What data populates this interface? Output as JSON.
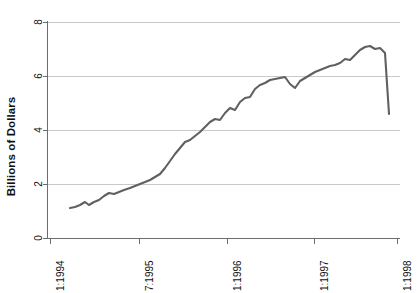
{
  "chart": {
    "type": "line",
    "ylabel": "Billions of Dollars",
    "xlabel": "",
    "title": "",
    "grid": true,
    "legend": false,
    "line_color": "#606060",
    "grid_color": "#c9c9c9",
    "axis_color": "#6d6d6d"
  },
  "axes": {
    "y_ticks": [
      "0",
      "2",
      "4",
      "6",
      "8"
    ],
    "y_values": [
      0,
      2,
      4,
      6,
      8
    ],
    "ylim": [
      0,
      8
    ],
    "x_ticks": [
      "1:1994",
      "7:1995",
      "1:1996",
      "1:1997",
      "1:1998"
    ],
    "x_tick_values": [
      1994.0,
      1995.5,
      1996.0,
      1997.0,
      1998.0
    ],
    "xlim": [
      1994.0,
      1998.0
    ]
  },
  "chart_data": {
    "type": "line",
    "title": "",
    "xlabel": "",
    "ylabel": "Billions of Dollars",
    "ylim": [
      0,
      8
    ],
    "xlim": [
      1994.0,
      1998.0
    ],
    "grid": true,
    "legend": false,
    "xtick_labels": [
      "1:1994",
      "7:1995",
      "1:1996",
      "1:1997",
      "1:1998"
    ],
    "ytick_labels": [
      "0",
      "2",
      "4",
      "6",
      "8"
    ],
    "x": [
      1994.58,
      1994.67,
      1994.75,
      1994.83,
      1994.92,
      1995.0,
      1995.08,
      1995.17,
      1995.25,
      1995.33,
      1995.42,
      1995.5,
      1995.58,
      1995.67,
      1995.75,
      1995.83,
      1995.92,
      1996.0,
      1996.08,
      1996.17,
      1996.25,
      1996.33,
      1996.42,
      1996.5,
      1996.58,
      1996.67,
      1996.75,
      1996.83,
      1996.92,
      1997.0,
      1997.08,
      1997.17,
      1997.25,
      1997.33,
      1997.42,
      1997.5,
      1997.58,
      1997.67,
      1997.75,
      1997.83,
      1997.92,
      1998.0
    ],
    "values": [
      1.1,
      1.12,
      1.25,
      1.2,
      1.28,
      1.35,
      1.45,
      1.43,
      1.45,
      1.52,
      1.6,
      1.68,
      1.75,
      1.85,
      2.1,
      2.45,
      2.7,
      2.95,
      3.0,
      3.2,
      3.35,
      3.55,
      3.62,
      3.6,
      3.95,
      4.12,
      4.05,
      4.4,
      4.62,
      4.65,
      5.05,
      5.2,
      5.35,
      5.5,
      5.52,
      5.6,
      5.22,
      5.5,
      5.75,
      6.2,
      6.15,
      6.5
    ],
    "series": [
      {
        "name": "Billions of Dollars",
        "points": [
          [
            1994.58,
            1.1
          ],
          [
            1994.67,
            1.12
          ],
          [
            1994.75,
            1.25
          ],
          [
            1994.83,
            1.2
          ],
          [
            1994.92,
            1.28
          ],
          [
            1995.0,
            1.35
          ],
          [
            1995.08,
            1.45
          ],
          [
            1995.17,
            1.43
          ],
          [
            1995.25,
            1.45
          ],
          [
            1995.33,
            1.52
          ],
          [
            1995.42,
            1.6
          ],
          [
            1995.5,
            1.68
          ],
          [
            1995.58,
            1.75
          ],
          [
            1995.67,
            1.85
          ],
          [
            1995.75,
            2.1
          ],
          [
            1995.83,
            2.45
          ],
          [
            1995.92,
            2.7
          ],
          [
            1996.0,
            2.95
          ],
          [
            1996.08,
            3.0
          ],
          [
            1996.17,
            3.2
          ],
          [
            1996.25,
            3.35
          ],
          [
            1996.33,
            3.55
          ],
          [
            1996.42,
            3.62
          ],
          [
            1996.5,
            3.6
          ],
          [
            1996.58,
            3.95
          ],
          [
            1996.67,
            4.12
          ],
          [
            1996.75,
            4.05
          ],
          [
            1996.83,
            4.4
          ],
          [
            1996.92,
            4.62
          ],
          [
            1997.0,
            4.65
          ],
          [
            1997.08,
            5.05
          ],
          [
            1997.17,
            5.2
          ],
          [
            1997.25,
            5.35
          ],
          [
            1997.33,
            5.5
          ],
          [
            1997.42,
            5.52
          ],
          [
            1997.5,
            5.6
          ],
          [
            1997.58,
            5.22
          ],
          [
            1997.67,
            5.5
          ],
          [
            1997.75,
            5.75
          ],
          [
            1997.83,
            6.2
          ],
          [
            1997.92,
            6.15
          ],
          [
            1998.0,
            6.5
          ]
        ]
      }
    ]
  },
  "pixel_path": {
    "comment": "polyline points in plot-local coordinates (352x216 box, y=0 is 8 billion, y=216 is 0)",
    "points": "22,186 27,185 32,183 37,180 41,183 46,180 51,178 56,174 61,171 66,172 71,170 76,168 82,166 87,164 92,162 97,160 102,158 107,155 112,152 117,146 122,139 127,132 132,126 137,120 142,118 147,114 152,110 157,105 162,100 167,97 172,98 177,91 182,86 187,88 192,80 197,76 202,75 207,67 212,63 217,61 222,58 227,57 232,56 237,55 242,62 247,66 252,59 257,56 262,53 267,50 272,48 277,46 282,44 287,43 292,41 297,37 302,38 307,33 312,28 317,25 322,24 327,27 332,26 337,31 341,92"
  }
}
